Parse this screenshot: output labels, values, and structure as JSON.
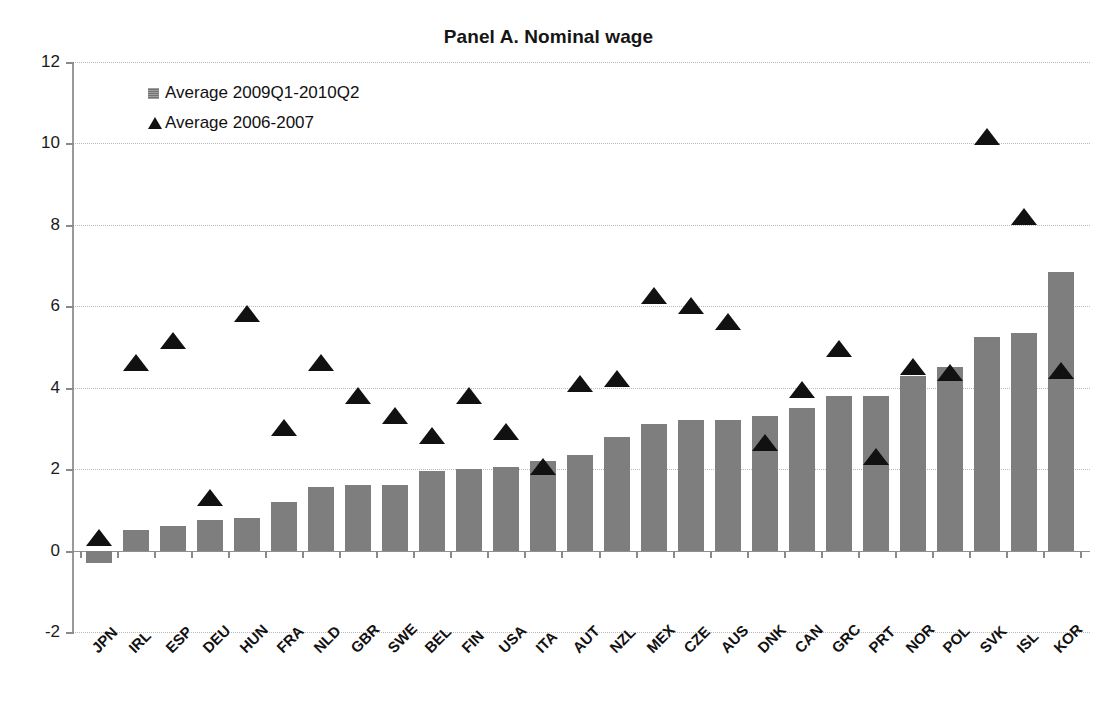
{
  "chart_data": {
    "type": "bar",
    "title": "Panel A. Nominal wage",
    "xlabel": "",
    "ylabel": "",
    "ylim": [
      -2,
      12
    ],
    "yticks": [
      -2,
      0,
      2,
      4,
      6,
      8,
      10,
      12
    ],
    "grid": true,
    "legend_position": "top-left",
    "categories": [
      "JPN",
      "IRL",
      "ESP",
      "DEU",
      "HUN",
      "FRA",
      "NLD",
      "GBR",
      "SWE",
      "BEL",
      "FIN",
      "USA",
      "ITA",
      "AUT",
      "NZL",
      "MEX",
      "CZE",
      "AUS",
      "DNK",
      "CAN",
      "GRC",
      "PRT",
      "NOR",
      "POL",
      "SVK",
      "ISL",
      "KOR"
    ],
    "series": [
      {
        "name": "Average 2009Q1-2010Q2",
        "type": "bar",
        "color": "#7e7e7e",
        "values": [
          -0.3,
          0.5,
          0.6,
          0.75,
          0.8,
          1.2,
          1.55,
          1.6,
          1.6,
          1.95,
          2.0,
          2.05,
          2.2,
          2.35,
          2.8,
          3.1,
          3.2,
          3.2,
          3.3,
          3.5,
          3.8,
          3.8,
          4.3,
          4.5,
          5.25,
          5.35,
          6.85
        ]
      },
      {
        "name": "Average 2006-2007",
        "type": "scatter",
        "marker": "triangle",
        "color": "#111111",
        "values": [
          0.5,
          4.8,
          5.35,
          1.5,
          6.0,
          3.2,
          4.8,
          4.0,
          3.5,
          3.0,
          4.0,
          3.1,
          2.25,
          4.3,
          4.4,
          6.45,
          6.2,
          5.8,
          2.85,
          4.15,
          5.15,
          2.5,
          4.7,
          4.55,
          10.35,
          8.4,
          4.6
        ]
      }
    ]
  },
  "legend": {
    "items": [
      {
        "label": "Average 2009Q1-2010Q2",
        "marker": "square-swatch"
      },
      {
        "label": "Average 2006-2007",
        "marker": "triangle-swatch"
      }
    ]
  }
}
